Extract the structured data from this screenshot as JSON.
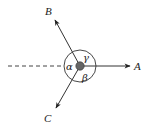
{
  "diagram": {
    "type": "force-vector-diagram",
    "center_point": {
      "x": 80,
      "y": 66,
      "fill": "#666666"
    },
    "circle": {
      "cx": 80,
      "cy": 66,
      "r": 16
    },
    "vectors": [
      {
        "id": "A",
        "label": "A",
        "to": {
          "x": 130,
          "y": 66
        },
        "label_pos": {
          "x": 134,
          "y": 70
        }
      },
      {
        "id": "B",
        "label": "B",
        "to": {
          "x": 55,
          "y": 20
        },
        "label_pos": {
          "x": 45,
          "y": 15
        }
      },
      {
        "id": "C",
        "label": "C",
        "to": {
          "x": 56,
          "y": 108
        },
        "label_pos": {
          "x": 44,
          "y": 122
        }
      }
    ],
    "dashed_line": {
      "from": {
        "x": 8,
        "y": 66
      },
      "to": {
        "x": 64,
        "y": 66
      }
    },
    "angles": [
      {
        "symbol": "α",
        "label_pos": {
          "x": 67,
          "y": 70
        }
      },
      {
        "symbol": "β",
        "label_pos": {
          "x": 82,
          "y": 81
        }
      },
      {
        "symbol": "γ",
        "label_pos": {
          "x": 83,
          "y": 61
        }
      }
    ],
    "colors": {
      "line": "#333333",
      "dot": "#666666",
      "text": "#222222"
    }
  }
}
